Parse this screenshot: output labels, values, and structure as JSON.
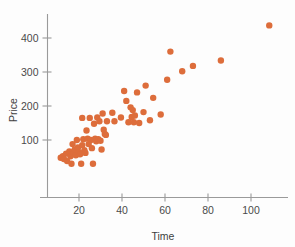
{
  "chart_data": {
    "type": "scatter",
    "title": "",
    "xlabel": "Time",
    "ylabel": "Price",
    "xlim": [
      8,
      118
    ],
    "ylim": [
      20,
      455
    ],
    "xticks": [
      20,
      40,
      60,
      80,
      100
    ],
    "yticks": [
      100,
      200,
      300,
      400
    ],
    "grid": false,
    "legend": null,
    "marker_color": "#dd6d3b",
    "marker_size": 3.2,
    "axis_color": "#9a9a9a",
    "text_color": "#4a4a4a",
    "background": "#fdfdfd",
    "points": [
      {
        "x": 11.5,
        "y": 48
      },
      {
        "x": 12.5,
        "y": 52
      },
      {
        "x": 13.0,
        "y": 44
      },
      {
        "x": 14.0,
        "y": 60
      },
      {
        "x": 14.5,
        "y": 38
      },
      {
        "x": 15.5,
        "y": 66
      },
      {
        "x": 16.0,
        "y": 52
      },
      {
        "x": 16.5,
        "y": 30
      },
      {
        "x": 17.0,
        "y": 88
      },
      {
        "x": 17.5,
        "y": 62
      },
      {
        "x": 18.0,
        "y": 72
      },
      {
        "x": 18.5,
        "y": 55
      },
      {
        "x": 19.0,
        "y": 100
      },
      {
        "x": 19.5,
        "y": 78
      },
      {
        "x": 20.0,
        "y": 64
      },
      {
        "x": 20.5,
        "y": 58
      },
      {
        "x": 21.0,
        "y": 30
      },
      {
        "x": 21.5,
        "y": 165
      },
      {
        "x": 21.5,
        "y": 85
      },
      {
        "x": 22.0,
        "y": 102
      },
      {
        "x": 22.5,
        "y": 70
      },
      {
        "x": 23.0,
        "y": 62
      },
      {
        "x": 23.5,
        "y": 128
      },
      {
        "x": 24.0,
        "y": 104
      },
      {
        "x": 24.5,
        "y": 88
      },
      {
        "x": 25.0,
        "y": 165
      },
      {
        "x": 25.5,
        "y": 100
      },
      {
        "x": 26.0,
        "y": 76
      },
      {
        "x": 26.5,
        "y": 30
      },
      {
        "x": 27.0,
        "y": 148
      },
      {
        "x": 27.5,
        "y": 104
      },
      {
        "x": 28.0,
        "y": 96
      },
      {
        "x": 28.5,
        "y": 166
      },
      {
        "x": 29.0,
        "y": 102
      },
      {
        "x": 29.5,
        "y": 155
      },
      {
        "x": 30.0,
        "y": 98
      },
      {
        "x": 30.5,
        "y": 72
      },
      {
        "x": 31.0,
        "y": 178
      },
      {
        "x": 31.5,
        "y": 130
      },
      {
        "x": 32.0,
        "y": 118
      },
      {
        "x": 32.5,
        "y": 115
      },
      {
        "x": 33.0,
        "y": 155
      },
      {
        "x": 35.5,
        "y": 180
      },
      {
        "x": 36.5,
        "y": 155
      },
      {
        "x": 39.5,
        "y": 166
      },
      {
        "x": 41.0,
        "y": 244
      },
      {
        "x": 42.0,
        "y": 215
      },
      {
        "x": 43.0,
        "y": 152
      },
      {
        "x": 44.0,
        "y": 196
      },
      {
        "x": 44.5,
        "y": 168
      },
      {
        "x": 45.0,
        "y": 188
      },
      {
        "x": 45.5,
        "y": 152
      },
      {
        "x": 46.0,
        "y": 172
      },
      {
        "x": 47.0,
        "y": 240
      },
      {
        "x": 48.0,
        "y": 150
      },
      {
        "x": 50.0,
        "y": 182
      },
      {
        "x": 51.0,
        "y": 260
      },
      {
        "x": 53.0,
        "y": 158
      },
      {
        "x": 54.5,
        "y": 224
      },
      {
        "x": 58.0,
        "y": 175
      },
      {
        "x": 61.0,
        "y": 277
      },
      {
        "x": 62.5,
        "y": 360
      },
      {
        "x": 68.0,
        "y": 302
      },
      {
        "x": 73.0,
        "y": 318
      },
      {
        "x": 86.0,
        "y": 334
      },
      {
        "x": 108.5,
        "y": 437
      }
    ]
  },
  "figure": {
    "xtick_labels": [
      "20",
      "40",
      "60",
      "80",
      "100"
    ],
    "ytick_labels": [
      "100",
      "200",
      "300",
      "400"
    ],
    "x_axis_title": "Time",
    "y_axis_title": "Price"
  }
}
